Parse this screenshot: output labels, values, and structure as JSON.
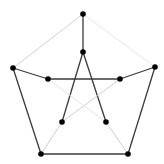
{
  "graph": {
    "name": "Petersen graph",
    "width": 164,
    "height": 164,
    "background": "#ffffff",
    "node_color": "#000000",
    "node_radius": 2.8,
    "colors": {
      "dark": "#3a3a3a",
      "light": "#cfcfcf",
      "faint": "#e6e6e6"
    },
    "nodes": [
      {
        "id": "outer-top",
        "x": 83,
        "y": 14
      },
      {
        "id": "outer-left",
        "x": 13,
        "y": 68
      },
      {
        "id": "outer-right",
        "x": 155,
        "y": 67
      },
      {
        "id": "outer-bottom-left",
        "x": 41,
        "y": 154
      },
      {
        "id": "outer-bottom-right",
        "x": 128,
        "y": 154
      },
      {
        "id": "inner-top",
        "x": 83,
        "y": 52
      },
      {
        "id": "inner-left",
        "x": 48,
        "y": 79
      },
      {
        "id": "inner-right",
        "x": 120,
        "y": 79
      },
      {
        "id": "inner-bottom-left",
        "x": 62,
        "y": 122
      },
      {
        "id": "inner-bottom-right",
        "x": 106,
        "y": 122
      }
    ],
    "edges": [
      {
        "from": "outer-top",
        "to": "outer-left",
        "tone": "light"
      },
      {
        "from": "outer-top",
        "to": "outer-right",
        "tone": "faint"
      },
      {
        "from": "outer-left",
        "to": "outer-bottom-left",
        "tone": "dark"
      },
      {
        "from": "outer-right",
        "to": "outer-bottom-right",
        "tone": "dark"
      },
      {
        "from": "outer-bottom-left",
        "to": "outer-bottom-right",
        "tone": "dark"
      },
      {
        "from": "outer-top",
        "to": "inner-top",
        "tone": "dark"
      },
      {
        "from": "outer-left",
        "to": "inner-left",
        "tone": "dark"
      },
      {
        "from": "outer-right",
        "to": "inner-right",
        "tone": "dark"
      },
      {
        "from": "outer-bottom-left",
        "to": "inner-bottom-left",
        "tone": "light"
      },
      {
        "from": "outer-bottom-right",
        "to": "inner-bottom-right",
        "tone": "light"
      },
      {
        "from": "inner-left",
        "to": "inner-right",
        "tone": "dark"
      },
      {
        "from": "inner-top",
        "to": "inner-bottom-left",
        "tone": "dark"
      },
      {
        "from": "inner-top",
        "to": "inner-bottom-right",
        "tone": "dark"
      },
      {
        "from": "inner-right",
        "to": "inner-bottom-left",
        "tone": "light"
      },
      {
        "from": "inner-left",
        "to": "inner-bottom-right",
        "tone": "faint"
      }
    ]
  }
}
